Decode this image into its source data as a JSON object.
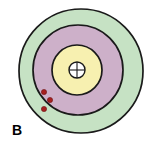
{
  "figure": {
    "panel_label": "B",
    "background_color": "#ffffff",
    "width": 146,
    "height": 151,
    "outline_color": "#1a1a1a"
  },
  "chart_data": {
    "type": "pie",
    "title": "",
    "subtitle": "",
    "xlabel": "",
    "ylabel": "",
    "legend_position": "none",
    "grid": false,
    "rendering": "concentric-zone-diagram",
    "center": {
      "x": 81,
      "y": 71
    },
    "categories": [
      "Outer zone",
      "Middle zone",
      "Inner zone",
      "Core"
    ],
    "values": [
      62,
      45,
      25,
      8
    ],
    "value_unit": "radius-px",
    "zones": [
      {
        "name": "outer-zone",
        "label": "",
        "radius": 62,
        "fill": "#c6e2c4",
        "stroke": "#1a1a1a"
      },
      {
        "name": "middle-zone",
        "label": "",
        "radius": 45,
        "fill": "#cdb0c9",
        "stroke": "#1a1a1a"
      },
      {
        "name": "inner-zone",
        "label": "",
        "radius": 25,
        "fill": "#f7f0b0",
        "stroke": "#1a1a1a"
      },
      {
        "name": "core-circle",
        "label": "",
        "radius": 8,
        "fill": "#ffffff",
        "stroke": "#1a1a1a"
      }
    ],
    "core_marker": {
      "name": "crosshair",
      "type": "cross",
      "color": "#1a1a1a"
    },
    "markers": {
      "name": "red-dots",
      "count": 3,
      "color": "#a81f1f",
      "radius": 2.6,
      "points": [
        {
          "x": 44,
          "y": 92
        },
        {
          "x": 50,
          "y": 100
        },
        {
          "x": 44,
          "y": 109
        }
      ]
    }
  }
}
